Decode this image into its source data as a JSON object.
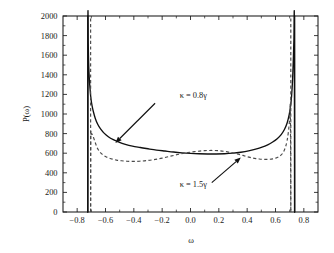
{
  "chart_data": {
    "type": "line",
    "title": "",
    "xlabel": "ω",
    "ylabel": "P(ω)",
    "xlim": [
      -0.9,
      0.9
    ],
    "ylim": [
      0,
      2000
    ],
    "grid": false,
    "legend_position": "inline-annotations",
    "xticks": [
      -0.8,
      -0.6,
      -0.4,
      -0.2,
      0.0,
      0.2,
      0.4,
      0.6,
      0.8
    ],
    "xtick_labels": [
      "−0.8",
      "−0.6",
      "−0.4",
      "−0.2",
      "0.0",
      "0.2",
      "0.4",
      "0.6",
      "0.8"
    ],
    "yticks": [
      0,
      200,
      400,
      600,
      800,
      1000,
      1200,
      1400,
      1600,
      1800,
      2000
    ],
    "ytick_labels": [
      "0",
      "200",
      "400",
      "600",
      "800",
      "1000",
      "1200",
      "1400",
      "1600",
      "1800",
      "2000"
    ],
    "xminor_step": 0.1,
    "yminor_step": 100,
    "annotations": [
      {
        "text": "κ = 0.8γ",
        "text_x": 0.02,
        "text_y": 1165,
        "arrow_from_x": -0.25,
        "arrow_from_y": 1110,
        "arrow_to_x": -0.53,
        "arrow_to_y": 705,
        "series": "kappa_0_8_gamma"
      },
      {
        "text": "κ = 1.5γ",
        "text_x": 0.02,
        "text_y": 255,
        "arrow_from_x": 0.15,
        "arrow_from_y": 300,
        "arrow_to_x": 0.355,
        "arrow_to_y": 555,
        "series": "kappa_1_5_gamma"
      }
    ],
    "series": [
      {
        "name": "κ = 0.8γ",
        "style": "solid",
        "color": "#111111",
        "cutoff_left": -0.725,
        "cutoff_right": 0.735,
        "x": [
          -0.725,
          -0.724,
          -0.722,
          -0.719,
          -0.715,
          -0.71,
          -0.703,
          -0.695,
          -0.685,
          -0.672,
          -0.655,
          -0.635,
          -0.61,
          -0.58,
          -0.545,
          -0.505,
          -0.46,
          -0.41,
          -0.355,
          -0.3,
          -0.24,
          -0.18,
          -0.12,
          -0.06,
          0.0,
          0.06,
          0.12,
          0.18,
          0.24,
          0.3,
          0.355,
          0.41,
          0.46,
          0.505,
          0.545,
          0.58,
          0.612,
          0.64,
          0.663,
          0.682,
          0.697,
          0.709,
          0.718,
          0.725,
          0.73,
          0.733,
          0.735
        ],
        "y": [
          0,
          1960,
          1720,
          1520,
          1380,
          1270,
          1160,
          1085,
          1020,
          955,
          895,
          848,
          805,
          768,
          738,
          712,
          690,
          672,
          658,
          645,
          632,
          622,
          612,
          604,
          598,
          594,
          592,
          592,
          594,
          600,
          610,
          624,
          642,
          662,
          686,
          714,
          748,
          790,
          842,
          908,
          995,
          1110,
          1280,
          1520,
          1760,
          1950,
          0
        ]
      },
      {
        "name": "κ = 1.5γ",
        "style": "dashed",
        "color": "#4a4a4a",
        "cutoff_left": -0.705,
        "cutoff_right": 0.708,
        "x": [
          -0.705,
          -0.704,
          -0.702,
          -0.699,
          -0.695,
          -0.69,
          -0.684,
          -0.678,
          -0.672,
          -0.666,
          -0.66,
          -0.652,
          -0.643,
          -0.632,
          -0.618,
          -0.6,
          -0.578,
          -0.552,
          -0.522,
          -0.488,
          -0.45,
          -0.408,
          -0.362,
          -0.312,
          -0.258,
          -0.2,
          -0.14,
          -0.08,
          -0.02,
          0.04,
          0.1,
          0.158,
          0.212,
          0.262,
          0.308,
          0.348,
          0.382,
          0.412,
          0.438,
          0.462,
          0.485,
          0.508,
          0.532,
          0.556,
          0.58,
          0.602,
          0.622,
          0.64,
          0.656,
          0.67,
          0.682,
          0.692,
          0.7,
          0.705,
          0.708
        ],
        "y": [
          0,
          760,
          790,
          800,
          795,
          780,
          758,
          732,
          706,
          682,
          660,
          638,
          618,
          600,
          583,
          566,
          552,
          540,
          530,
          523,
          518,
          516,
          518,
          524,
          534,
          550,
          570,
          590,
          606,
          618,
          626,
          628,
          624,
          614,
          600,
          586,
          572,
          560,
          551,
          545,
          541,
          538,
          537,
          538,
          542,
          550,
          562,
          582,
          612,
          660,
          730,
          830,
          955,
          1045,
          0
        ]
      }
    ]
  }
}
